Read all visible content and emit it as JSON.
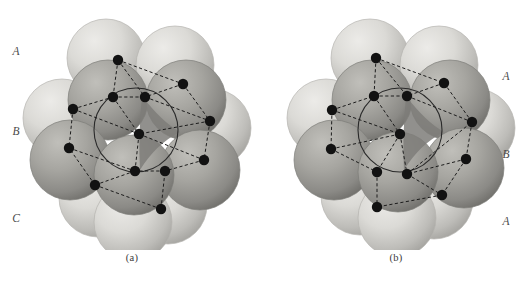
{
  "figure": {
    "type": "close-packed-sphere-stacking-diagram",
    "background_color": "#ffffff",
    "panels": [
      {
        "id": "a",
        "caption": "(a)",
        "stacking_sequence": "ABC",
        "structure_name": "cubic close-packed",
        "label_side": "left",
        "layer_labels": [
          {
            "text": "A",
            "y": 45
          },
          {
            "text": "B",
            "y": 125
          },
          {
            "text": "C",
            "y": 212
          }
        ]
      },
      {
        "id": "b",
        "caption": "(b)",
        "stacking_sequence": "ABA",
        "structure_name": "hexagonal close-packed",
        "label_side": "right",
        "layer_labels": [
          {
            "text": "A",
            "y": 70
          },
          {
            "text": "B",
            "y": 148
          },
          {
            "text": "A",
            "y": 215
          }
        ]
      }
    ],
    "colors": {
      "sphere_light": "#d8d7d3",
      "sphere_light_shadow": "#a9a8a4",
      "sphere_dark": "#a3a29d",
      "sphere_dark_shadow": "#74736f",
      "interstitial_wedge": "#7e7d79",
      "lattice_dot": "#121212",
      "lattice_line": "#1c1c1c",
      "label_text": "#4a4a4a",
      "caption_text": "#3a3a3a"
    },
    "legend_notes": {
      "dot_meaning": "lattice site / sphere center",
      "line_style": "dashed",
      "circle_meaning": "outlined central sphere of middle layer"
    }
  },
  "chart_data": {
    "type": "scatter",
    "title": "",
    "xlabel": "",
    "ylabel": "",
    "panels": [
      {
        "id": "a",
        "caption": "(a)",
        "stacking": "ABC",
        "spheres": [
          {
            "cx": 106,
            "cy": 58,
            "r": 39,
            "layer": "A",
            "shade": "light"
          },
          {
            "cx": 175,
            "cy": 65,
            "r": 39,
            "layer": "A",
            "shade": "light"
          },
          {
            "cx": 62,
            "cy": 118,
            "r": 39,
            "layer": "A",
            "shade": "light"
          },
          {
            "cx": 212,
            "cy": 128,
            "r": 39,
            "layer": "A",
            "shade": "light"
          },
          {
            "cx": 98,
            "cy": 198,
            "r": 39,
            "layer": "C",
            "shade": "light"
          },
          {
            "cx": 168,
            "cy": 205,
            "r": 39,
            "layer": "C",
            "shade": "light"
          },
          {
            "cx": 133,
            "cy": 222,
            "r": 39,
            "layer": "C",
            "shade": "light"
          },
          {
            "cx": 108,
            "cy": 100,
            "r": 40,
            "layer": "B",
            "shade": "dark"
          },
          {
            "cx": 186,
            "cy": 100,
            "r": 40,
            "layer": "B",
            "shade": "dark"
          },
          {
            "cx": 70,
            "cy": 160,
            "r": 40,
            "layer": "B",
            "shade": "dark"
          },
          {
            "cx": 200,
            "cy": 170,
            "r": 40,
            "layer": "B",
            "shade": "dark"
          },
          {
            "cx": 134,
            "cy": 175,
            "r": 40,
            "layer": "B",
            "shade": "dark"
          }
        ],
        "center_circle": {
          "cx": 136,
          "cy": 130,
          "r": 42
        },
        "dots": [
          {
            "x": 118,
            "y": 60
          },
          {
            "x": 183,
            "y": 84
          },
          {
            "x": 113,
            "y": 97
          },
          {
            "x": 145,
            "y": 97
          },
          {
            "x": 73,
            "y": 109
          },
          {
            "x": 210,
            "y": 121
          },
          {
            "x": 139,
            "y": 134
          },
          {
            "x": 69,
            "y": 148
          },
          {
            "x": 204,
            "y": 160
          },
          {
            "x": 135,
            "y": 171
          },
          {
            "x": 165,
            "y": 171
          },
          {
            "x": 95,
            "y": 185
          },
          {
            "x": 161,
            "y": 209
          }
        ],
        "edges": [
          [
            0,
            1
          ],
          [
            0,
            2
          ],
          [
            2,
            3
          ],
          [
            1,
            3
          ],
          [
            4,
            2
          ],
          [
            4,
            7
          ],
          [
            3,
            5
          ],
          [
            5,
            6
          ],
          [
            6,
            4
          ],
          [
            6,
            8
          ],
          [
            7,
            9
          ],
          [
            9,
            6
          ],
          [
            8,
            10
          ],
          [
            10,
            9
          ],
          [
            11,
            9
          ],
          [
            11,
            7
          ],
          [
            12,
            10
          ],
          [
            12,
            11
          ],
          [
            2,
            6
          ],
          [
            5,
            8
          ],
          [
            1,
            5
          ],
          [
            0,
            3
          ]
        ]
      },
      {
        "id": "b",
        "caption": "(b)",
        "stacking": "ABA",
        "spheres": [
          {
            "cx": 106,
            "cy": 58,
            "r": 39,
            "layer": "A",
            "shade": "light"
          },
          {
            "cx": 175,
            "cy": 65,
            "r": 39,
            "layer": "A",
            "shade": "light"
          },
          {
            "cx": 62,
            "cy": 118,
            "r": 39,
            "layer": "A",
            "shade": "light"
          },
          {
            "cx": 212,
            "cy": 128,
            "r": 39,
            "layer": "A",
            "shade": "light"
          },
          {
            "cx": 96,
            "cy": 196,
            "r": 39,
            "layer": "A",
            "shade": "light"
          },
          {
            "cx": 170,
            "cy": 200,
            "r": 39,
            "layer": "A",
            "shade": "light"
          },
          {
            "cx": 133,
            "cy": 218,
            "r": 39,
            "layer": "A",
            "shade": "light"
          },
          {
            "cx": 108,
            "cy": 100,
            "r": 40,
            "layer": "B",
            "shade": "dark"
          },
          {
            "cx": 186,
            "cy": 100,
            "r": 40,
            "layer": "B",
            "shade": "dark"
          },
          {
            "cx": 70,
            "cy": 160,
            "r": 40,
            "layer": "B",
            "shade": "dark"
          },
          {
            "cx": 200,
            "cy": 168,
            "r": 40,
            "layer": "B",
            "shade": "dark"
          },
          {
            "cx": 134,
            "cy": 172,
            "r": 40,
            "layer": "B",
            "shade": "dark"
          }
        ],
        "center_circle": {
          "cx": 136,
          "cy": 130,
          "r": 42
        },
        "dots": [
          {
            "x": 112,
            "y": 58
          },
          {
            "x": 180,
            "y": 83
          },
          {
            "x": 110,
            "y": 96
          },
          {
            "x": 143,
            "y": 96
          },
          {
            "x": 68,
            "y": 110
          },
          {
            "x": 208,
            "y": 122
          },
          {
            "x": 136,
            "y": 134
          },
          {
            "x": 67,
            "y": 149
          },
          {
            "x": 202,
            "y": 159
          },
          {
            "x": 113,
            "y": 172
          },
          {
            "x": 143,
            "y": 174
          },
          {
            "x": 178,
            "y": 195
          },
          {
            "x": 113,
            "y": 207
          }
        ],
        "edges": [
          [
            0,
            1
          ],
          [
            0,
            2
          ],
          [
            2,
            3
          ],
          [
            1,
            3
          ],
          [
            4,
            2
          ],
          [
            4,
            7
          ],
          [
            3,
            5
          ],
          [
            5,
            8
          ],
          [
            6,
            9
          ],
          [
            6,
            10
          ],
          [
            7,
            9
          ],
          [
            9,
            12
          ],
          [
            8,
            10
          ],
          [
            10,
            11
          ],
          [
            11,
            12
          ],
          [
            2,
            6
          ],
          [
            1,
            5
          ],
          [
            0,
            3
          ],
          [
            4,
            6
          ],
          [
            8,
            11
          ],
          [
            7,
            6
          ],
          [
            10,
            5
          ]
        ]
      }
    ]
  }
}
